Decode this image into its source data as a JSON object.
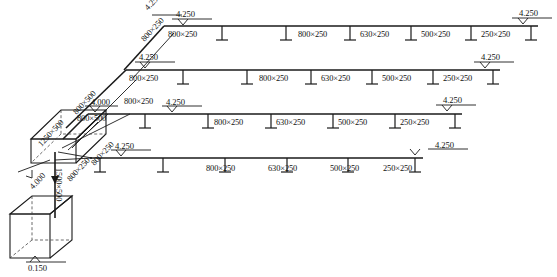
{
  "diagram": {
    "type": "duct-riser-diagram",
    "colors": {
      "line": "#1a1a1a",
      "background": "#ffffff",
      "dashed": "#444444"
    },
    "base_elevation": "0.150",
    "riser_elevations": [
      "4.000",
      "4.000"
    ],
    "vertical_duct_size": "1500×500",
    "diagonal_duct_sizes": [
      "1250×500",
      "800×500",
      "800×250",
      "800×250",
      "800×500"
    ],
    "branch_start_sizes": [
      "800×250",
      "800×250",
      "800×250"
    ],
    "branches": [
      {
        "id": "branch-1",
        "elevation_start": "4.250",
        "elevation_end": "4.250",
        "riser_elevation": "4.250",
        "riser_size": "800×250",
        "segments": [
          "800×250",
          "800×250",
          "630×250",
          "500×250",
          "250×250"
        ]
      },
      {
        "id": "branch-2",
        "elevation_start": "4.250",
        "elevation_end": "4.250",
        "segments": [
          "800×250",
          "800×250",
          "630×250",
          "500×250",
          "250×250"
        ]
      },
      {
        "id": "branch-3",
        "elevation_start": "4.250",
        "elevation_end": "4.250",
        "lead_elevation": "4.000",
        "lead_size": "800×250",
        "segments": [
          "800×250",
          "630×250",
          "500×250",
          "250×250"
        ]
      },
      {
        "id": "branch-4",
        "elevation_start": "4.250",
        "elevation_end": "4.250",
        "segments": [
          "800×250",
          "630×250",
          "500×250",
          "250×250"
        ]
      }
    ],
    "labels": [
      {
        "key": "b1-elev-riser",
        "text": "4.250",
        "x": 143,
        "y": 6,
        "rot": -47
      },
      {
        "key": "b1-size-riser",
        "text": "800×250",
        "x": 140,
        "y": 38,
        "rot": -47
      },
      {
        "key": "b1-elev-left",
        "text": "4.250",
        "x": 176,
        "y": 10,
        "rot": 0
      },
      {
        "key": "b1-elev-right",
        "text": "4.250",
        "x": 519,
        "y": 9,
        "rot": 0
      },
      {
        "key": "b1-seg-1",
        "text": "800×250",
        "x": 168,
        "y": 31,
        "rot": 0
      },
      {
        "key": "b1-seg-2",
        "text": "800×250",
        "x": 298,
        "y": 31,
        "rot": 0
      },
      {
        "key": "b1-seg-3",
        "text": "630×250",
        "x": 360,
        "y": 31,
        "rot": 0
      },
      {
        "key": "b1-seg-4",
        "text": "500×250",
        "x": 421,
        "y": 31,
        "rot": 0
      },
      {
        "key": "b1-seg-5",
        "text": "250×250",
        "x": 481,
        "y": 31,
        "rot": 0
      },
      {
        "key": "b2-elev-left",
        "text": "4.250",
        "x": 139,
        "y": 53,
        "rot": 0
      },
      {
        "key": "b2-elev-right",
        "text": "4.250",
        "x": 481,
        "y": 53,
        "rot": 0
      },
      {
        "key": "b2-seg-1",
        "text": "800×250",
        "x": 129,
        "y": 75,
        "rot": 0
      },
      {
        "key": "b2-seg-2",
        "text": "800×250",
        "x": 259,
        "y": 75,
        "rot": 0
      },
      {
        "key": "b2-seg-3",
        "text": "630×250",
        "x": 321,
        "y": 75,
        "rot": 0
      },
      {
        "key": "b2-seg-4",
        "text": "500×250",
        "x": 382,
        "y": 75,
        "rot": 0
      },
      {
        "key": "b2-seg-5",
        "text": "250×250",
        "x": 443,
        "y": 75,
        "rot": 0
      },
      {
        "key": "b3-elev-lead",
        "text": "4.000",
        "x": 91,
        "y": 98,
        "rot": 0
      },
      {
        "key": "b3-size-lead",
        "text": "800×250",
        "x": 124,
        "y": 98,
        "rot": 0
      },
      {
        "key": "b3-elev-left",
        "text": "4.250",
        "x": 166,
        "y": 98,
        "rot": 0
      },
      {
        "key": "b3-elev-right",
        "text": "4.250",
        "x": 443,
        "y": 96,
        "rot": 0
      },
      {
        "key": "b3-seg-1",
        "text": "800×250",
        "x": 214,
        "y": 119,
        "rot": 0
      },
      {
        "key": "b3-seg-2",
        "text": "630×250",
        "x": 276,
        "y": 119,
        "rot": 0
      },
      {
        "key": "b3-seg-3",
        "text": "500×250",
        "x": 338,
        "y": 119,
        "rot": 0
      },
      {
        "key": "b3-seg-4",
        "text": "250×250",
        "x": 400,
        "y": 119,
        "rot": 0
      },
      {
        "key": "b4-elev-left",
        "text": "4.250",
        "x": 115,
        "y": 142,
        "rot": 0
      },
      {
        "key": "b4-elev-right",
        "text": "4.250",
        "x": 435,
        "y": 141,
        "rot": 0
      },
      {
        "key": "b4-seg-1",
        "text": "800×250",
        "x": 206,
        "y": 165,
        "rot": 0
      },
      {
        "key": "b4-seg-2",
        "text": "630×250",
        "x": 268,
        "y": 165,
        "rot": 0
      },
      {
        "key": "b4-seg-3",
        "text": "500×250",
        "x": 330,
        "y": 165,
        "rot": 0
      },
      {
        "key": "b4-seg-4",
        "text": "250×250",
        "x": 383,
        "y": 165,
        "rot": 0
      },
      {
        "key": "d-1250x500",
        "text": "1250×500",
        "x": 37,
        "y": 143,
        "rot": -47
      },
      {
        "key": "d-800x500-top",
        "text": "800×500",
        "x": 72,
        "y": 111,
        "rot": -47
      },
      {
        "key": "d-800x500-box",
        "text": "800×500",
        "x": 77,
        "y": 115,
        "rot": 0
      },
      {
        "key": "d-800x250-mid",
        "text": "800×250",
        "x": 90,
        "y": 162,
        "rot": -47
      },
      {
        "key": "d-800x250-low",
        "text": "800×250",
        "x": 66,
        "y": 178,
        "rot": -47
      },
      {
        "key": "riser-elev",
        "text": "4.000",
        "x": 28,
        "y": 185,
        "rot": -47
      },
      {
        "key": "vert-size",
        "text": "1500×500",
        "x": 62,
        "y": 168,
        "rot": 90
      },
      {
        "key": "base-elev",
        "text": "0.150",
        "x": 28,
        "y": 264,
        "rot": 0
      }
    ]
  }
}
